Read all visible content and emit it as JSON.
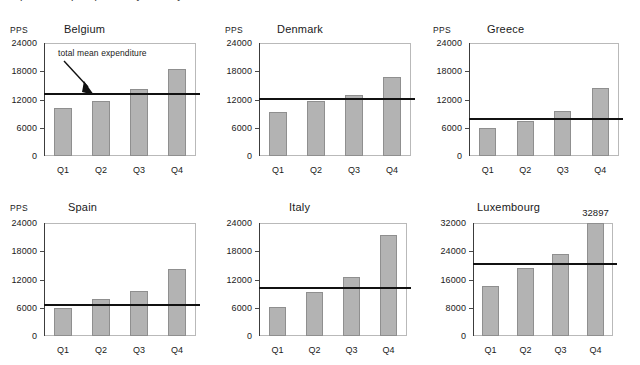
{
  "caption": {
    "text": "expenditure per quarter by country"
  },
  "axis": {
    "unit_label": "PPS",
    "x_categories": [
      "Q1",
      "Q2",
      "Q3",
      "Q4"
    ],
    "ticks_standard": [
      "0",
      "6000",
      "12000",
      "18000",
      "24000"
    ],
    "ticks_luxembourg": [
      "0",
      "8000",
      "16000",
      "24000",
      "32000"
    ]
  },
  "annotation": {
    "label": "total mean expenditure"
  },
  "colors": {
    "bar_fill": "#b3b3b3",
    "bar_stroke": "#8f8f8f",
    "mean_line": "#111111",
    "axis": "#3c3c3c",
    "frame": "#b9b9b9"
  },
  "chart_data": [
    {
      "type": "bar",
      "title": "Belgium",
      "xlabel": "",
      "ylabel": "PPS",
      "categories": [
        "Q1",
        "Q2",
        "Q3",
        "Q4"
      ],
      "values": [
        10300,
        11600,
        14200,
        18400
      ],
      "ylim": [
        0,
        24000
      ],
      "yticks": [
        0,
        6000,
        12000,
        18000,
        24000
      ],
      "grid": false,
      "legend": "none",
      "reference_line": {
        "label": "total mean expenditure",
        "value": 13400
      },
      "annotations": [
        "total mean expenditure"
      ]
    },
    {
      "type": "bar",
      "title": "Denmark",
      "xlabel": "",
      "ylabel": "PPS",
      "categories": [
        "Q1",
        "Q2",
        "Q3",
        "Q4"
      ],
      "values": [
        9400,
        11700,
        13000,
        16800
      ],
      "ylim": [
        0,
        24000
      ],
      "yticks": [
        0,
        6000,
        12000,
        18000,
        24000
      ],
      "grid": false,
      "legend": "none",
      "reference_line": {
        "label": "total mean expenditure",
        "value": 12400
      }
    },
    {
      "type": "bar",
      "title": "Greece",
      "xlabel": "",
      "ylabel": "PPS",
      "categories": [
        "Q1",
        "Q2",
        "Q3",
        "Q4"
      ],
      "values": [
        5900,
        7500,
        9600,
        14400
      ],
      "ylim": [
        0,
        24000
      ],
      "yticks": [
        0,
        6000,
        12000,
        18000,
        24000
      ],
      "grid": false,
      "legend": "none",
      "reference_line": {
        "label": "total mean expenditure",
        "value": 8000
      }
    },
    {
      "type": "bar",
      "title": "Spain",
      "xlabel": "",
      "ylabel": "PPS",
      "categories": [
        "Q1",
        "Q2",
        "Q3",
        "Q4"
      ],
      "values": [
        6000,
        7800,
        9500,
        14200
      ],
      "ylim": [
        0,
        24000
      ],
      "yticks": [
        0,
        6000,
        12000,
        18000,
        24000
      ],
      "grid": false,
      "legend": "none",
      "reference_line": {
        "label": "total mean expenditure",
        "value": 6700
      }
    },
    {
      "type": "bar",
      "title": "Italy",
      "xlabel": "",
      "ylabel": "",
      "categories": [
        "Q1",
        "Q2",
        "Q3",
        "Q4"
      ],
      "values": [
        6100,
        9300,
        12600,
        21500
      ],
      "ylim": [
        0,
        24000
      ],
      "yticks": [
        0,
        6000,
        12000,
        18000,
        24000
      ],
      "grid": false,
      "legend": "none",
      "reference_line": {
        "label": "total mean expenditure",
        "value": 10500
      }
    },
    {
      "type": "bar",
      "title": "Luxembourg",
      "xlabel": "",
      "ylabel": "",
      "categories": [
        "Q1",
        "Q2",
        "Q3",
        "Q4"
      ],
      "values": [
        14300,
        19400,
        23200,
        32897
      ],
      "ylim": [
        0,
        32000
      ],
      "yticks": [
        0,
        8000,
        16000,
        24000,
        32000
      ],
      "grid": false,
      "legend": "none",
      "data_labels": {
        "Q4": "32897"
      },
      "reference_line": {
        "label": "total mean expenditure",
        "value": 20600
      }
    }
  ]
}
